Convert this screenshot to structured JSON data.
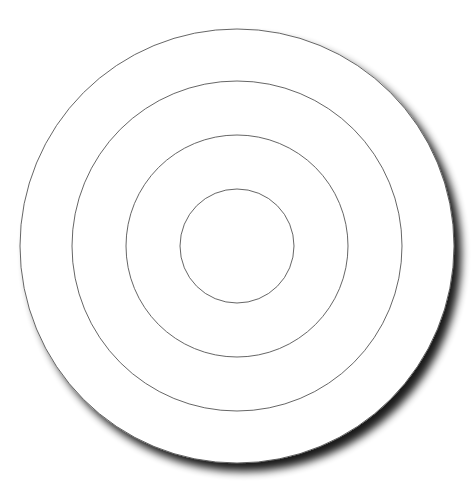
{
  "figure": {
    "center": [
      237,
      246
    ],
    "disc": {
      "radius": 217,
      "fill": "#ffffff",
      "stroke": "#555555",
      "shadow_color": "#000000",
      "shadow_offset": [
        8,
        8
      ],
      "shadow_blur": 6
    },
    "rings": [
      {
        "radius": 165,
        "stroke": "#555555"
      },
      {
        "radius": 111,
        "stroke": "#555555"
      },
      {
        "radius": 57,
        "stroke": "#555555"
      }
    ]
  }
}
